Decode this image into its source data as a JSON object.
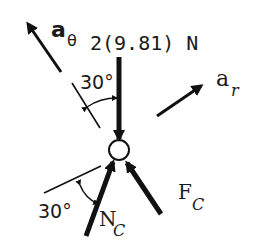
{
  "diagram": {
    "type": "free-body-diagram",
    "colors": {
      "ink": "#111111",
      "background": "#ffffff"
    },
    "labels": {
      "a_theta": {
        "main": "a",
        "sub": "θ"
      },
      "weight": "2(9.81) N",
      "a_r": {
        "main": "a",
        "sub": "r"
      },
      "angle_upper": "30°",
      "angle_lower": "30°",
      "normal_force": {
        "main": "N",
        "sub": "C"
      },
      "friction_force": {
        "main": "F",
        "sub": "C"
      }
    },
    "elements": [
      "particle-circle",
      "weight-arrow",
      "a-theta-arrow",
      "a-r-arrow",
      "normal-force-arrow",
      "friction-force-arrow",
      "upper-reference-line",
      "lower-reference-line",
      "upper-angle-arc",
      "lower-angle-arc"
    ]
  }
}
